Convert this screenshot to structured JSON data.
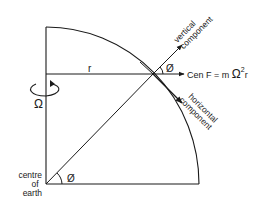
{
  "diagram": {
    "type": "physics-diagram",
    "labels": {
      "radius": "r",
      "rotation": "Ω",
      "centre_line1": "centre",
      "centre_line2": "of",
      "centre_line3": "earth",
      "angle_center": "Ø",
      "angle_surface": "Ø",
      "vertical_line1": "vertical",
      "vertical_line2": "component",
      "horizontal_line1": "horizontal",
      "horizontal_line2": "component",
      "force_prefix": "Cen F = m ",
      "force_omega": "Ω",
      "force_exp": "2",
      "force_suffix": "r"
    },
    "colors": {
      "line": "#1a1a1a",
      "background": "#ffffff"
    }
  }
}
